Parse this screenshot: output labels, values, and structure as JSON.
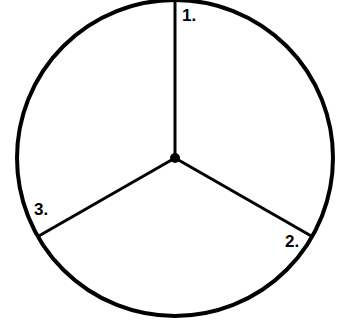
{
  "diagram": {
    "type": "circle divided into three sectors",
    "labels": [
      "1.",
      "2.",
      "3."
    ],
    "stroke_color": "#000000"
  }
}
